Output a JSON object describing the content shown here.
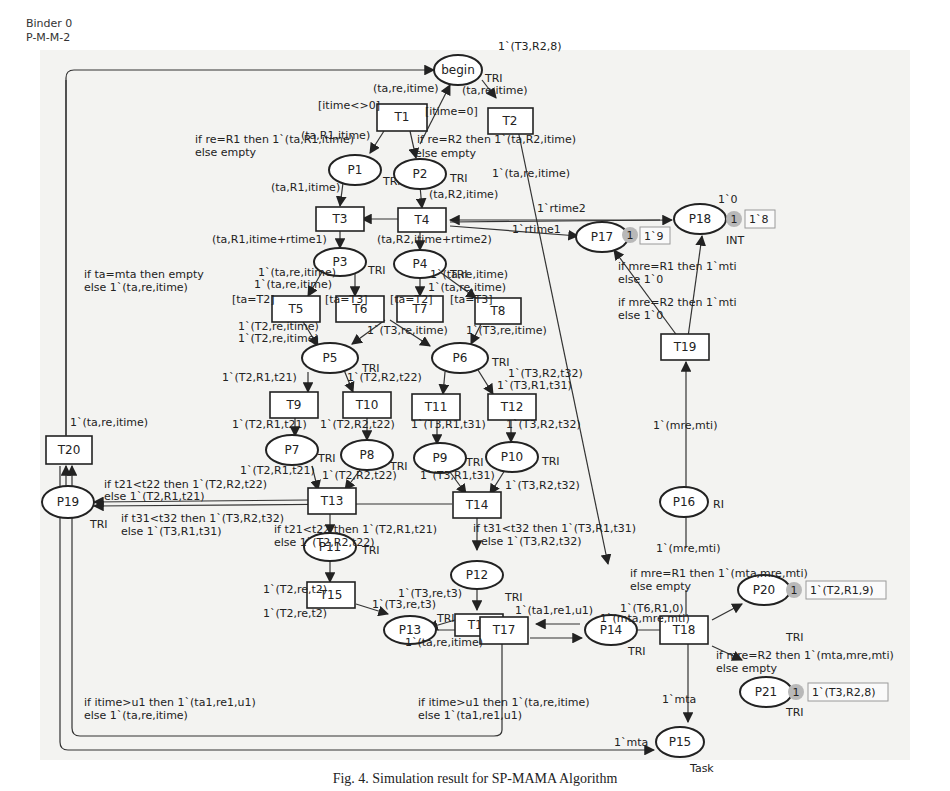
{
  "header": {
    "binder": "Binder 0",
    "page": "P-M-M-2"
  },
  "caption": "Fig. 4. Simulation result for SP-MAMA Algorithm",
  "places": {
    "begin": {
      "label": "begin",
      "colset": "TRI"
    },
    "P1": {
      "label": "P1",
      "colset": "TRI"
    },
    "P2": {
      "label": "P2",
      "colset": "TRI"
    },
    "P3": {
      "label": "P3",
      "colset": "TRI"
    },
    "P4": {
      "label": "P4",
      "colset": "TRI"
    },
    "P5": {
      "label": "P5",
      "colset": "TRI"
    },
    "P6": {
      "label": "P6",
      "colset": "TRI"
    },
    "P7": {
      "label": "P7",
      "colset": "TRI"
    },
    "P8": {
      "label": "P8",
      "colset": "TRI"
    },
    "P9": {
      "label": "P9",
      "colset": "TRI"
    },
    "P10": {
      "label": "P10",
      "colset": "TRI"
    },
    "P11": {
      "label": "P11",
      "colset": "TRI"
    },
    "P12": {
      "label": "P12",
      "colset": "TRI"
    },
    "P13": {
      "label": "P13",
      "colset": "TRI"
    },
    "P14": {
      "label": "P14",
      "colset": "TRI"
    },
    "P15": {
      "label": "P15",
      "colset": "Task"
    },
    "P16": {
      "label": "P16",
      "colset": "RI"
    },
    "P17": {
      "label": "P17",
      "colset": "INT",
      "tokens": "1",
      "marking": "1`9"
    },
    "P18": {
      "label": "P18",
      "colset": "INT",
      "initial": "1`0",
      "tokens": "1",
      "marking": "1`8"
    },
    "P19": {
      "label": "P19",
      "colset": "TRI"
    },
    "P20": {
      "label": "P20",
      "colset": "TRI",
      "tokens": "1",
      "marking": "1`(T2,R1,9)"
    },
    "P21": {
      "label": "P21",
      "colset": "TRI",
      "tokens": "1",
      "marking": "1`(T3,R2,8)"
    }
  },
  "transitions": {
    "T1": "T1",
    "T2": "T2",
    "T3": "T3",
    "T4": "T4",
    "T5": "T5",
    "T6": "T6",
    "T7": "T7",
    "T8": "T8",
    "T9": "T9",
    "T10": "T10",
    "T11": "T11",
    "T12": "T12",
    "T13": "T13",
    "T14": "T14",
    "T15": "T15",
    "T16": "T16",
    "T17": "T17",
    "T18": "T18",
    "T19": "T19",
    "T20": "T20"
  },
  "guards": {
    "T1": "[itime<>0]",
    "T2": "[itime=0]",
    "T5": "[ta=T2]",
    "T6": "[ta=T3]",
    "T7": "[ta=T2]",
    "T8": "[ta=T3]"
  },
  "inscriptions": {
    "begin_initial": "1`(T3,R2,8)",
    "begin_T1": "(ta,re,itime)",
    "begin_T2": "(ta,re,itime)",
    "T1_P1_a": "if re=R1 then 1`(ta,R1,itime)",
    "T1_P1_b": "else empty",
    "T1_P1_short": "(ta,R1,itime)",
    "T1_P2_a": "if re=R2 then 1`(ta,R2,itime)",
    "T1_P2_b": "else empty",
    "T2_P14": "1`(ta,re,itime)",
    "P1_T3": "(ta,R1,itime)",
    "P2_T4": "(ta,R2,itime)",
    "T3_P3": "(ta,R1,itime+rtime1)",
    "T4_P4": "(ta,R2,itime+rtime2)",
    "T4_P17_rtime2": "1`rtime2",
    "T4_P17_rtime1": "1`rtime1",
    "P3_T5": "1`(ta,re,itime)",
    "P3_T6": "1`(ta,re,itime)",
    "P4_T7": "1`(ta,re,itime)",
    "P4_T8": "1`(ta,re,itime)",
    "T5_P5_a": "1`(T2,re,itime)",
    "T5_P5_b": "1`(T2,re,itime)",
    "T6_P6": "1`(T3,re,itime)",
    "T8_P6": "1`(T3,re,itime)",
    "P5_T9": "1`(T2,R1,t21)",
    "P5_T10": "1`(T2,R2,t22)",
    "P6_T11": "1`(T3,R2,t32)",
    "P6_T12": "1`(T3,R1,t31)",
    "T9_P7": "1`(T2,R1,t21)",
    "T10_P8": "1`(T2,R2,t22)",
    "T11_P9": "1`(T3,R1,t31)",
    "T12_P10": "1`(T3,R2,t32)",
    "P7_T13": "1`(T2,R1,t21)",
    "P8_T13": "1`(T2,R2,t22)",
    "P9_T14": "1`(T3,R1,t31)",
    "P10_T14": "1`(T3,R2,t32)",
    "T13_P19_a": "if t21<t22 then 1`(T2,R2,t22)",
    "T13_P19_b": "else 1`(T2,R1,t21)",
    "T14_P19_a": "if t31<t32 then 1`(T3,R2,t32)",
    "T14_P19_b": "else 1`(T3,R1,t31)",
    "T13_P11_a": "if t21<t22 then 1`(T2,R1,t21)",
    "T13_P11_b": "else 1`(T2,R2,t22)",
    "T14_P12_a": "if t31<t32 then 1`(T3,R1,t31)",
    "T14_P12_b": "else 1`(T3,R2,t32)",
    "P11_T15": "1`(T2,re,t2)",
    "P12_T16": "1`(T3,re,t3)",
    "T15_P13": "1`(T2,re,t2)",
    "T16_P13": "1`(T3,re,t3)",
    "P13_T17": "1`(ta,re,itime)",
    "P14_T17": "1`(ta1,re1,u1)",
    "P14_init": "1`(T6,R1,0)",
    "P14_T18": "1`(mta,mre,mti)",
    "T17_T20_a": "if itime>u1 then 1`(ta1,re1,u1)",
    "T17_T20_b": "else 1`(ta,re,itime)",
    "T17_P14_a": "if itime>u1 then 1`(ta,re,itime)",
    "T17_P14_b": "else 1`(ta1,re1,u1)",
    "T20_P3": "if ta=mta then empty",
    "T20_P3_b": "else 1`(ta,re,itime)",
    "P19_T20": "1`(ta,re,itime)",
    "T18_P20_a": "if mre=R1 then 1`(mta,mre,mti)",
    "T18_P20_b": "else empty",
    "T18_P21_a": "if mre=R2 then 1`(mta,mre,mti)",
    "T18_P21_b": "else empty",
    "T18_P15": "1`mta",
    "T20_P15": "1`mta",
    "P16_T18": "1`(mre,mti)",
    "P16_T19": "1`(mre,mti)",
    "T19_P17_a": "if mre=R1 then 1`mti",
    "T19_P17_b": "else 1`0",
    "T19_P18_a": "if mre=R2 then 1`mti",
    "T19_P18_b": "else 1`0"
  }
}
